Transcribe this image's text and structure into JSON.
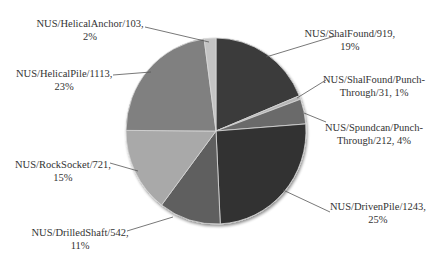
{
  "chart_data": {
    "type": "pie",
    "title": "",
    "start_angle_deg": 0,
    "direction": "clockwise",
    "slices": [
      {
        "name": "NUS/ShalFound",
        "value": 919,
        "percent": "19%",
        "color": "#3a3a3a",
        "label_lines": [
          "NUS/ShalFound/919,",
          "19%"
        ]
      },
      {
        "name": "NUS/ShalFound/Punch-Through",
        "value": 31,
        "percent": "1%",
        "color": "#b5b5b5",
        "label_lines": [
          "NUS/ShalFound/Punch-",
          "Through/31, 1%"
        ]
      },
      {
        "name": "NUS/Spundcan/Punch-Through",
        "value": 212,
        "percent": "4%",
        "color": "#6b6b6b",
        "label_lines": [
          "NUS/Spundcan/Punch-",
          "Through/212, 4%"
        ]
      },
      {
        "name": "NUS/DrivenPile",
        "value": 1243,
        "percent": "25%",
        "color": "#333333",
        "label_lines": [
          "NUS/DrivenPile/1243,",
          "25%"
        ]
      },
      {
        "name": "NUS/DrilledShaft",
        "value": 542,
        "percent": "11%",
        "color": "#5e5e5e",
        "label_lines": [
          "NUS/DrilledShaft/542,",
          "11%"
        ]
      },
      {
        "name": "NUS/RockSocket",
        "value": 721,
        "percent": "15%",
        "color": "#a9a9a9",
        "label_lines": [
          "NUS/RockSocket/721,",
          "15%"
        ]
      },
      {
        "name": "NUS/HelicalPile",
        "value": 1113,
        "percent": "23%",
        "color": "#808080",
        "label_lines": [
          "NUS/HelicalPile/1113,",
          "23%"
        ]
      },
      {
        "name": "NUS/HelicalAnchor",
        "value": 103,
        "percent": "2%",
        "color": "#c4c4c4",
        "label_lines": [
          "NUS/HelicalAnchor/103,",
          "2%"
        ]
      }
    ],
    "legend": "none",
    "data_labels": "category/value, percent with leader lines"
  },
  "labels": [
    {
      "x": 350,
      "y": 27,
      "line1": "NUS/ShalFound/919,",
      "line2": "19%",
      "lx1": 335,
      "ly1": 36,
      "lx2": 266,
      "ly2": 57
    },
    {
      "x": 374,
      "y": 73,
      "line1": "NUS/ShalFound/Punch-",
      "line2": "Through/31, 1%",
      "lx1": 326,
      "ly1": 80,
      "lx2": 297,
      "ly2": 98
    },
    {
      "x": 374,
      "y": 121,
      "line1": "NUS/Spundcan/Punch-",
      "line2": "Through/212, 4%",
      "lx1": 326,
      "ly1": 122,
      "lx2": 304,
      "ly2": 113
    },
    {
      "x": 378,
      "y": 200,
      "line1": "NUS/DrivenPile/1243,",
      "line2": "25%",
      "lx1": 330,
      "ly1": 212,
      "lx2": 283,
      "ly2": 190
    },
    {
      "x": 80,
      "y": 226,
      "line1": "NUS/DrilledShaft/542,",
      "line2": "11%",
      "lx1": 127,
      "ly1": 231,
      "lx2": 173,
      "ly2": 217
    },
    {
      "x": 63,
      "y": 158,
      "line1": "NUS/RockSocket/721,",
      "line2": "15%",
      "lx1": 110,
      "ly1": 163,
      "lx2": 138,
      "ly2": 171
    },
    {
      "x": 64,
      "y": 67,
      "line1": "NUS/HelicalPile/1113,",
      "line2": "23%",
      "lx1": 113,
      "ly1": 75,
      "lx2": 151,
      "ly2": 72
    },
    {
      "x": 90,
      "y": 17,
      "line1": "NUS/HelicalAnchor/103,",
      "line2": "2%",
      "lx1": 145,
      "ly1": 27,
      "lx2": 209,
      "ly2": 42
    }
  ]
}
